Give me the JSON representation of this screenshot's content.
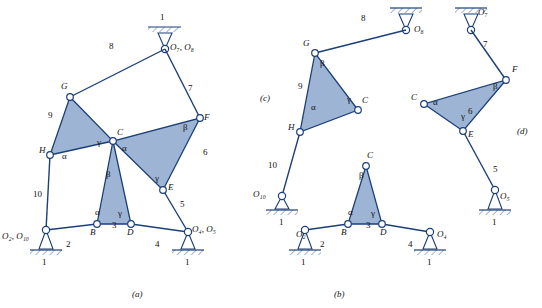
{
  "figure": {
    "title": "",
    "background": "#ffffff",
    "link_fill": "#9db4d4",
    "link_stroke": "#1b3f78",
    "line_color": "#1b3f78",
    "text_color": "#111111",
    "captions": [
      {
        "id": "a",
        "text": "(a)",
        "x": 138,
        "y": 296
      },
      {
        "id": "b",
        "text": "(b)",
        "x": 340,
        "y": 296
      },
      {
        "id": "c",
        "text": "(c)",
        "x": 266,
        "y": 100
      },
      {
        "id": "d",
        "text": "(d)",
        "x": 520,
        "y": 133
      }
    ]
  },
  "panel_a": {
    "joint_labels": [
      {
        "text": "G",
        "x": 63,
        "y": 88
      },
      {
        "text": "C",
        "x": 117,
        "y": 133
      },
      {
        "text": "F",
        "x": 205,
        "y": 127
      },
      {
        "text": "H",
        "x": 43,
        "y": 148
      },
      {
        "text": "E",
        "x": 170,
        "y": 186
      },
      {
        "text": "B",
        "x": 89,
        "y": 236
      },
      {
        "text": "D",
        "x": 127,
        "y": 236
      }
    ],
    "ground_labels": [
      {
        "text": "O",
        "sub": "7",
        "sub2": ", O",
        "sub3": "8",
        "x": 163,
        "y": 65,
        "full": "O₇, O₈"
      },
      {
        "text": "O₂, O₁₀",
        "x": 2,
        "y": 238
      },
      {
        "text": "O₄, O₅",
        "x": 192,
        "y": 238
      }
    ],
    "link_numbers": [
      {
        "text": "8",
        "x": 110,
        "y": 48
      },
      {
        "text": "7",
        "x": 189,
        "y": 90
      },
      {
        "text": "9",
        "x": 54,
        "y": 117
      },
      {
        "text": "6",
        "x": 201,
        "y": 155
      },
      {
        "text": "10",
        "x": 39,
        "y": 197
      },
      {
        "text": "5",
        "x": 180,
        "y": 208
      },
      {
        "text": "2",
        "x": 66,
        "y": 245
      },
      {
        "text": "3",
        "x": 113,
        "y": 228
      },
      {
        "text": "4",
        "x": 155,
        "y": 247
      },
      {
        "text": "1",
        "x": 160,
        "y": 16
      },
      {
        "text": "1",
        "x": 35,
        "y": 263
      },
      {
        "text": "1",
        "x": 206,
        "y": 263
      }
    ],
    "greek_labels": [
      {
        "text": "α",
        "x": 64,
        "y": 160
      },
      {
        "text": "γ",
        "x": 98,
        "y": 146
      },
      {
        "text": "α",
        "x": 122,
        "y": 152
      },
      {
        "text": "β",
        "x": 184,
        "y": 130
      },
      {
        "text": "β",
        "x": 107,
        "y": 178
      },
      {
        "text": "γ",
        "x": 156,
        "y": 181
      },
      {
        "text": "α",
        "x": 96,
        "y": 215
      },
      {
        "text": "γ",
        "x": 119,
        "y": 216
      }
    ]
  },
  "panel_c": {
    "joint_labels": [
      {
        "text": "G",
        "x": 305,
        "y": 45
      },
      {
        "text": "C",
        "x": 363,
        "y": 101
      },
      {
        "text": "H",
        "x": 292,
        "y": 125
      }
    ],
    "ground_labels": [
      {
        "text": "O₈",
        "x": 419,
        "y": 30
      },
      {
        "text": "O₁₀",
        "x": 255,
        "y": 201
      }
    ],
    "link_numbers": [
      {
        "text": "8",
        "x": 362,
        "y": 19
      },
      {
        "text": "9",
        "x": 301,
        "y": 88
      },
      {
        "text": "10",
        "x": 274,
        "y": 167
      },
      {
        "text": "1",
        "x": 280,
        "y": 221
      }
    ],
    "greek_labels": [
      {
        "text": "β",
        "x": 322,
        "y": 66
      },
      {
        "text": "α",
        "x": 313,
        "y": 110
      },
      {
        "text": "γ",
        "x": 349,
        "y": 102
      }
    ]
  },
  "panel_d": {
    "joint_labels": [
      {
        "text": "F",
        "x": 511,
        "y": 70
      },
      {
        "text": "C",
        "x": 414,
        "y": 98
      },
      {
        "text": "E",
        "x": 470,
        "y": 132
      }
    ],
    "ground_labels": [
      {
        "text": "O₇",
        "x": 477,
        "y": 12
      },
      {
        "text": "O₅",
        "x": 502,
        "y": 203
      }
    ],
    "link_numbers": [
      {
        "text": "7",
        "x": 483,
        "y": 45
      },
      {
        "text": "6",
        "x": 468,
        "y": 113
      },
      {
        "text": "5",
        "x": 494,
        "y": 172
      },
      {
        "text": "1",
        "x": 481,
        "y": 221
      }
    ],
    "greek_labels": [
      {
        "text": "α",
        "x": 434,
        "y": 104
      },
      {
        "text": "β",
        "x": 494,
        "y": 88
      },
      {
        "text": "γ",
        "x": 462,
        "y": 119
      }
    ]
  },
  "panel_b": {
    "joint_labels": [
      {
        "text": "C",
        "x": 368,
        "y": 155
      },
      {
        "text": "B",
        "x": 342,
        "y": 236
      },
      {
        "text": "D",
        "x": 381,
        "y": 236
      }
    ],
    "ground_labels": [
      {
        "text": "O₂",
        "x": 298,
        "y": 239
      },
      {
        "text": "O₄",
        "x": 437,
        "y": 239
      }
    ],
    "link_numbers": [
      {
        "text": "2",
        "x": 320,
        "y": 246
      },
      {
        "text": "3",
        "x": 367,
        "y": 228
      },
      {
        "text": "4",
        "x": 408,
        "y": 247
      },
      {
        "text": "1",
        "x": 290,
        "y": 263
      },
      {
        "text": "1",
        "x": 447,
        "y": 263
      }
    ],
    "greek_labels": [
      {
        "text": "α",
        "x": 349,
        "y": 215
      },
      {
        "text": "β",
        "x": 360,
        "y": 178
      },
      {
        "text": "γ",
        "x": 372,
        "y": 216
      }
    ]
  }
}
